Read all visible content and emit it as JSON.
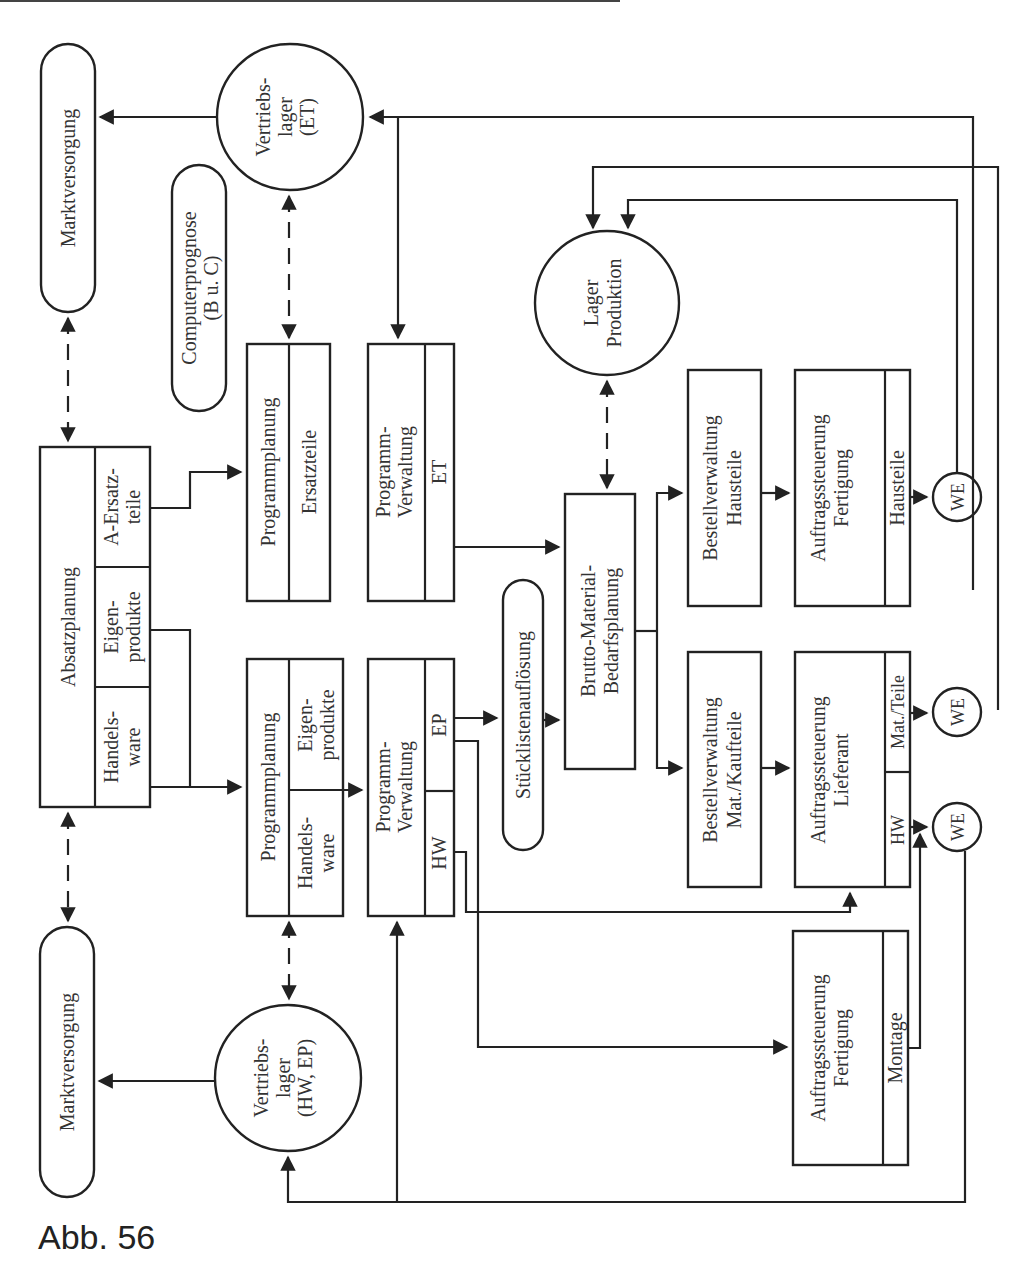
{
  "caption": "Abb. 56",
  "nodes": {
    "markt_top": "Marktversorgung",
    "markt_bottom": "Marktversorgung",
    "vertrieb_et": [
      "Vertriebs-",
      "lager",
      "(ET)"
    ],
    "vertrieb_hw_ep": [
      "Vertriebs-",
      "lager",
      "(HW, EP)"
    ],
    "computerprognose": [
      "Computerprognose",
      "(B u. C)"
    ],
    "absatzplanung": {
      "title": "Absatzplanung",
      "cells": [
        [
          "A-Ersatz-",
          "teile"
        ],
        [
          "Eigen-",
          "produkte"
        ],
        [
          "Handels-",
          "ware"
        ]
      ]
    },
    "programmplanung_et": {
      "title": "Programmplanung",
      "sub": "Ersatzteile"
    },
    "programmplanung_main": {
      "title": "Programmplanung",
      "cells": [
        [
          "Eigen-",
          "produkte"
        ],
        [
          "Handels-",
          "ware"
        ]
      ]
    },
    "programmverwaltung_et": {
      "title": [
        "Programm-",
        "Verwaltung"
      ],
      "sub": "ET"
    },
    "programmverwaltung_main": {
      "title": [
        "Programm-",
        "Verwaltung"
      ],
      "cells": [
        "EP",
        "HW"
      ]
    },
    "stuecklisten": "Stücklistenauflösung",
    "brutto": [
      "Brutto-Material-",
      "Bedarfsplanung"
    ],
    "lager_produktion": [
      "Lager",
      "Produktion"
    ],
    "bestell_haus": [
      "Bestellverwaltung",
      "Hausteile"
    ],
    "bestell_kauf": [
      "Bestellverwaltung",
      "Mat./Kaufteile"
    ],
    "auftrag_fert_haus": {
      "title": [
        "Auftragssteuerung",
        "Fertigung"
      ],
      "sub": "Hausteile"
    },
    "auftrag_lief": {
      "title": [
        "Auftragssteuerung",
        "Lieferant"
      ],
      "cells": [
        "Mat./Teile",
        "HW"
      ]
    },
    "auftrag_fert_mont": {
      "title": [
        "Auftragssteuerung",
        "Fertigung"
      ],
      "sub": "Montage"
    },
    "we": [
      "WE",
      "WE",
      "WE"
    ]
  }
}
